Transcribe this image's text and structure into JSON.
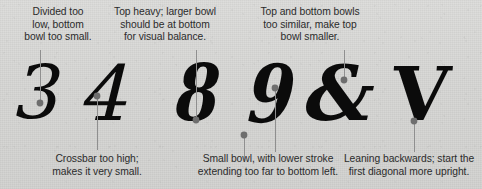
{
  "figure": {
    "title_visible": false,
    "background_color": "#d6d6d4",
    "ink_color": "#0b0b0b",
    "text_color": "#2b2b2b",
    "leader_color": "#8c8c8c",
    "dot_color": "#6e6e6e"
  },
  "top_captions": [
    {
      "id": "caption-3",
      "text": "Divided too\nlow, bottom\nbowl too small.",
      "target_glyph": "3"
    },
    {
      "id": "caption-4",
      "text": "Top heavy; larger bowl\nshould be at bottom\nfor visual balance.",
      "target_glyph": "4"
    },
    {
      "id": "caption-8",
      "text": "Top and bottom bowls\ntoo similar, make top\nbowl smaller.",
      "target_glyph": "8"
    }
  ],
  "bottom_captions": [
    {
      "id": "caption-crossbar",
      "text": "Crossbar too high;\nmakes it very small.",
      "target_glyph": "4"
    },
    {
      "id": "caption-smallbowl",
      "text": "Small bowl, with lower stroke\nextending too far to bottom left.",
      "target_glyph": "9"
    },
    {
      "id": "caption-leaning",
      "text": "Leaning backwards; start the\nfirst diagonal more upright.",
      "target_glyph": "V"
    }
  ],
  "glyphs": [
    {
      "id": "glyph-3",
      "char": "3"
    },
    {
      "id": "glyph-4",
      "char": "4"
    },
    {
      "id": "glyph-8",
      "char": "8"
    },
    {
      "id": "glyph-9",
      "char": "9"
    },
    {
      "id": "glyph-amp",
      "char": "&"
    },
    {
      "id": "glyph-v",
      "char": "V"
    }
  ]
}
